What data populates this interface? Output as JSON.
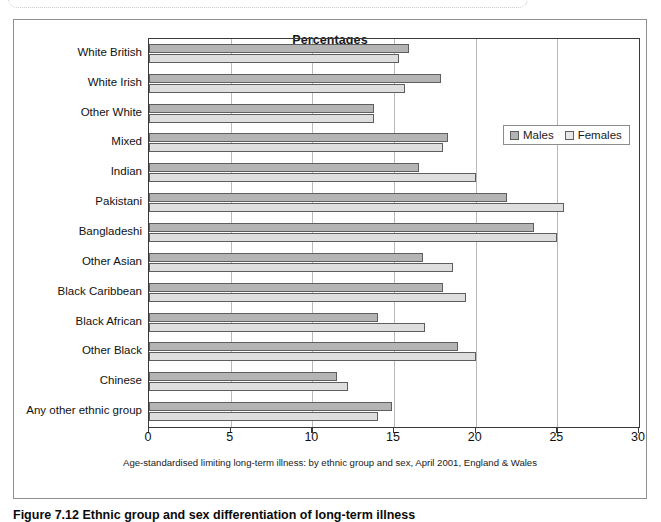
{
  "figure": {
    "caption": "Figure 7.12  Ethnic group and sex differentiation of long-term illness"
  },
  "chart": {
    "title": "Percentages",
    "axis_caption": "Age-standardised limiting long-term illness: by ethnic group and sex, April 2001, England & Wales",
    "legend": [
      {
        "label": "Males",
        "color": "#b4b4b4",
        "icon": "legend-swatch"
      },
      {
        "label": "Females",
        "color": "#e8e8e8",
        "icon": "legend-swatch"
      }
    ]
  },
  "chart_data": {
    "type": "bar",
    "orientation": "horizontal",
    "title": "Percentages",
    "xlabel": "",
    "ylabel": "",
    "xlim": [
      0,
      30
    ],
    "xticks": [
      0,
      5,
      10,
      15,
      20,
      25,
      30
    ],
    "grid": true,
    "legend_position": "upper right",
    "annotation": "Age-standardised limiting long-term illness: by ethnic group and sex, April 2001, England & Wales",
    "categories": [
      "White British",
      "White Irish",
      "Other White",
      "Mixed",
      "Indian",
      "Pakistani",
      "Bangladeshi",
      "Other Asian",
      "Black Caribbean",
      "Black African",
      "Other Black",
      "Chinese",
      "Any other ethnic group"
    ],
    "series": [
      {
        "name": "Males",
        "color": "#b4b4b4",
        "values": [
          15.9,
          17.9,
          13.8,
          18.3,
          16.5,
          21.9,
          23.6,
          16.8,
          18.0,
          14.0,
          18.9,
          11.5,
          14.9
        ]
      },
      {
        "name": "Females",
        "color": "#e8e8e8",
        "values": [
          15.3,
          15.7,
          13.8,
          18.0,
          20.0,
          25.4,
          25.0,
          18.6,
          19.4,
          16.9,
          20.0,
          12.2,
          14.0
        ]
      }
    ]
  }
}
